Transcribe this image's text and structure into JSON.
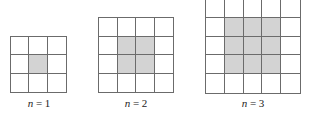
{
  "figures": [
    {
      "n": 1,
      "label_var": "n",
      "label_eq": " = ",
      "label_val": "1",
      "size": 3,
      "shaded": [
        [
          1,
          1
        ]
      ],
      "left": 10,
      "top": 36,
      "cell": 19,
      "label_x": 9,
      "label_y": 97
    },
    {
      "n": 2,
      "label_var": "n",
      "label_eq": " = ",
      "label_val": "2",
      "size": 4,
      "shaded": [
        [
          1,
          1
        ],
        [
          1,
          2
        ],
        [
          2,
          1
        ],
        [
          2,
          2
        ]
      ],
      "left": 98,
      "top": 17,
      "cell": 19,
      "label_x": 106,
      "label_y": 97
    },
    {
      "n": 3,
      "label_var": "n",
      "label_eq": " = ",
      "label_val": "3",
      "size": 5,
      "shaded": [
        [
          1,
          1
        ],
        [
          1,
          2
        ],
        [
          1,
          3
        ],
        [
          2,
          1
        ],
        [
          2,
          2
        ],
        [
          2,
          3
        ],
        [
          3,
          1
        ],
        [
          3,
          2
        ],
        [
          3,
          3
        ]
      ],
      "left": 205,
      "top": -2,
      "cell": 19.2,
      "label_x": 223,
      "label_y": 97
    }
  ],
  "colors": {
    "grid_line": "#6b6b6b",
    "shaded_cell": "#d3d3d3",
    "empty_cell": "#ffffff"
  }
}
